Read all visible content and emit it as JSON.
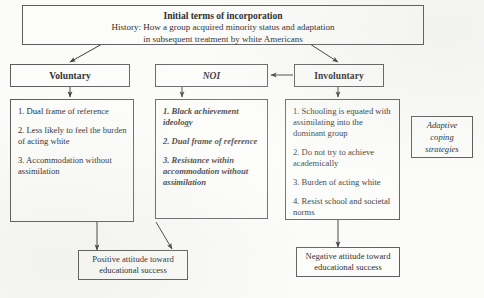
{
  "diagram": {
    "title_box": {
      "heading": "Initial terms of incorporation",
      "line2": "History: How a group acquired minority status and adaptation",
      "line3": "in subsequent treatment by white Americans"
    },
    "headers": {
      "voluntary": "Voluntary",
      "noi": "NOI",
      "involuntary": "Involuntary"
    },
    "voluntary_traits": [
      "1. Dual frame of reference",
      "2. Less likely to feel the burden of acting white",
      "3. Accommodation without assimilation"
    ],
    "noi_traits": [
      "1. Black achievement ideology",
      "2. Dual frame of reference",
      "3. Resistance within accommodation without assimilation"
    ],
    "involuntary_traits": [
      "1. Schooling is equated with assimilating into the dominant group",
      "2. Do not try to achieve academically",
      "3. Burden of acting white",
      "4. Resist school and societal norms"
    ],
    "side_note": {
      "line1": "Adaptive",
      "line2": "coping",
      "line3": "strategies"
    },
    "outcomes": {
      "positive": "Positive attitude toward educational success",
      "negative": "Negative attitude toward educational success"
    },
    "colors": {
      "background": "#fbfbf9",
      "box_fill": "#fcfcfa",
      "stroke": "#5d5d5d",
      "text": "#2b2b2b"
    }
  }
}
